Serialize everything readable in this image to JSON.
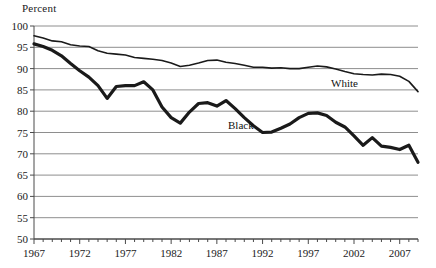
{
  "chart_data": {
    "type": "line",
    "title": "",
    "subtitle": "",
    "xlabel": "",
    "ylabel": "Percent",
    "ylim": [
      50,
      100
    ],
    "xlim": [
      1967,
      2009
    ],
    "yticks": [
      50,
      55,
      60,
      65,
      70,
      75,
      80,
      85,
      90,
      95,
      100
    ],
    "xticks": [
      1967,
      1972,
      1977,
      1982,
      1987,
      1992,
      1997,
      2002,
      2007
    ],
    "xtick_step": 1,
    "grid": "horizontal",
    "legend_position": "inline-annotation",
    "x": [
      1967,
      1968,
      1969,
      1970,
      1971,
      1972,
      1973,
      1974,
      1975,
      1976,
      1977,
      1978,
      1979,
      1980,
      1981,
      1982,
      1983,
      1984,
      1985,
      1986,
      1987,
      1988,
      1989,
      1990,
      1991,
      1992,
      1993,
      1994,
      1995,
      1996,
      1997,
      1998,
      1999,
      2000,
      2001,
      2002,
      2003,
      2004,
      2005,
      2006,
      2007,
      2008,
      2009
    ],
    "series": [
      {
        "name": "White",
        "color": "#1a1a1a",
        "line_width": 1.6,
        "label": "White",
        "values": [
          97.7,
          97.2,
          96.5,
          96.3,
          95.6,
          95.3,
          95.2,
          94.2,
          93.6,
          93.4,
          93.2,
          92.6,
          92.4,
          92.2,
          91.9,
          91.3,
          90.5,
          90.8,
          91.3,
          91.9,
          92.0,
          91.5,
          91.2,
          90.8,
          90.3,
          90.3,
          90.1,
          90.2,
          90.0,
          90.0,
          90.3,
          90.6,
          90.4,
          89.9,
          89.3,
          88.8,
          88.6,
          88.5,
          88.7,
          88.6,
          88.2,
          87.0,
          84.6
        ]
      },
      {
        "name": "Black",
        "color": "#1a1a1a",
        "line_width": 3.2,
        "label": "Black",
        "values": [
          95.8,
          95.2,
          94.3,
          93.0,
          91.2,
          89.5,
          88.0,
          86.0,
          83.0,
          85.8,
          86.0,
          86.0,
          86.9,
          85.0,
          81.0,
          78.5,
          77.2,
          79.8,
          81.8,
          82.0,
          81.2,
          82.5,
          80.6,
          78.5,
          76.6,
          75.0,
          75.1,
          76.0,
          77.0,
          78.5,
          79.5,
          79.6,
          79.0,
          77.4,
          76.3,
          74.2,
          72.0,
          73.8,
          71.8,
          71.5,
          71.0,
          72.0,
          68.0
        ]
      }
    ]
  },
  "labels": {
    "y_axis_title": "Percent",
    "white_label": "White",
    "black_label": "Black"
  }
}
